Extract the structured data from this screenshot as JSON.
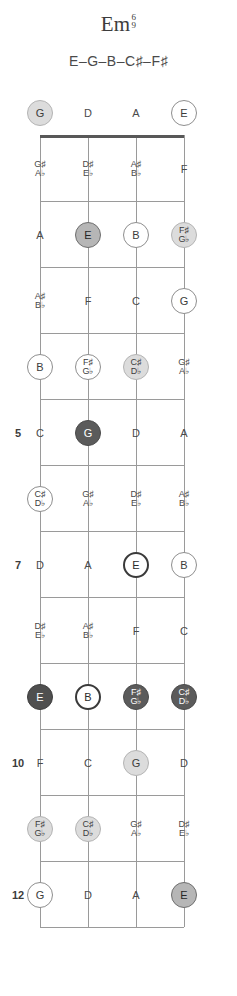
{
  "title": {
    "root": "Em",
    "ext_top": "6",
    "ext_bottom": "9"
  },
  "notes_line": "E–G–B–C♯–F♯",
  "diagram": {
    "instrument": "fretboard",
    "string_count": 4,
    "string_x": [
      40,
      88,
      136,
      184
    ],
    "nut_y": 135,
    "fret_spacing": 66,
    "fret_count": 12,
    "fret_markers": [
      "5",
      "7",
      "10",
      "12"
    ],
    "open_strings": [
      {
        "label": "G",
        "style": "fill-light"
      },
      {
        "label": "D",
        "style": "plain"
      },
      {
        "label": "A",
        "style": "plain"
      },
      {
        "label": "E",
        "style": "ring"
      }
    ],
    "frets": [
      {
        "number": 1,
        "marker": "",
        "notes": [
          {
            "label": "G♯",
            "label2": "A♭",
            "style": "plain"
          },
          {
            "label": "D♯",
            "label2": "E♭",
            "style": "plain"
          },
          {
            "label": "A♯",
            "label2": "B♭",
            "style": "plain"
          },
          {
            "label": "F",
            "label2": "",
            "style": "plain"
          }
        ]
      },
      {
        "number": 2,
        "marker": "",
        "notes": [
          {
            "label": "A",
            "label2": "",
            "style": "plain"
          },
          {
            "label": "E",
            "label2": "",
            "style": "fill-mid"
          },
          {
            "label": "B",
            "label2": "",
            "style": "ring"
          },
          {
            "label": "F♯",
            "label2": "G♭",
            "style": "fill-light"
          }
        ]
      },
      {
        "number": 3,
        "marker": "",
        "notes": [
          {
            "label": "A♯",
            "label2": "B♭",
            "style": "plain"
          },
          {
            "label": "F",
            "label2": "",
            "style": "plain"
          },
          {
            "label": "C",
            "label2": "",
            "style": "plain"
          },
          {
            "label": "G",
            "label2": "",
            "style": "ring"
          }
        ]
      },
      {
        "number": 4,
        "marker": "",
        "notes": [
          {
            "label": "B",
            "label2": "",
            "style": "ring"
          },
          {
            "label": "F♯",
            "label2": "G♭",
            "style": "ring"
          },
          {
            "label": "C♯",
            "label2": "D♭",
            "style": "fill-light"
          },
          {
            "label": "G♯",
            "label2": "A♭",
            "style": "plain"
          }
        ]
      },
      {
        "number": 5,
        "marker": "5",
        "notes": [
          {
            "label": "C",
            "label2": "",
            "style": "plain"
          },
          {
            "label": "G",
            "label2": "",
            "style": "fill-dark"
          },
          {
            "label": "D",
            "label2": "",
            "style": "plain"
          },
          {
            "label": "A",
            "label2": "",
            "style": "plain"
          }
        ]
      },
      {
        "number": 6,
        "marker": "",
        "notes": [
          {
            "label": "C♯",
            "label2": "D♭",
            "style": "ring"
          },
          {
            "label": "G♯",
            "label2": "A♭",
            "style": "plain"
          },
          {
            "label": "D♯",
            "label2": "E♭",
            "style": "plain"
          },
          {
            "label": "A♯",
            "label2": "B♭",
            "style": "plain"
          }
        ]
      },
      {
        "number": 7,
        "marker": "7",
        "notes": [
          {
            "label": "D",
            "label2": "",
            "style": "plain"
          },
          {
            "label": "A",
            "label2": "",
            "style": "plain"
          },
          {
            "label": "E",
            "label2": "",
            "style": "ring-dark"
          },
          {
            "label": "B",
            "label2": "",
            "style": "ring"
          }
        ]
      },
      {
        "number": 8,
        "marker": "",
        "notes": [
          {
            "label": "D♯",
            "label2": "E♭",
            "style": "plain"
          },
          {
            "label": "A♯",
            "label2": "B♭",
            "style": "plain"
          },
          {
            "label": "F",
            "label2": "",
            "style": "plain"
          },
          {
            "label": "C",
            "label2": "",
            "style": "plain"
          }
        ]
      },
      {
        "number": 9,
        "marker": "",
        "notes": [
          {
            "label": "E",
            "label2": "",
            "style": "fill-darker"
          },
          {
            "label": "B",
            "label2": "",
            "style": "ring-dark"
          },
          {
            "label": "F♯",
            "label2": "G♭",
            "style": "fill-dark"
          },
          {
            "label": "C♯",
            "label2": "D♭",
            "style": "fill-dark"
          }
        ]
      },
      {
        "number": 10,
        "marker": "10",
        "notes": [
          {
            "label": "F",
            "label2": "",
            "style": "plain"
          },
          {
            "label": "C",
            "label2": "",
            "style": "plain"
          },
          {
            "label": "G",
            "label2": "",
            "style": "fill-light"
          },
          {
            "label": "D",
            "label2": "",
            "style": "plain"
          }
        ]
      },
      {
        "number": 11,
        "marker": "",
        "notes": [
          {
            "label": "F♯",
            "label2": "G♭",
            "style": "fill-light"
          },
          {
            "label": "C♯",
            "label2": "D♭",
            "style": "fill-light"
          },
          {
            "label": "G♯",
            "label2": "A♭",
            "style": "plain"
          },
          {
            "label": "D♯",
            "label2": "E♭",
            "style": "plain"
          }
        ]
      },
      {
        "number": 12,
        "marker": "12",
        "notes": [
          {
            "label": "G",
            "label2": "",
            "style": "ring"
          },
          {
            "label": "D",
            "label2": "",
            "style": "plain"
          },
          {
            "label": "A",
            "label2": "",
            "style": "plain"
          },
          {
            "label": "E",
            "label2": "",
            "style": "fill-mid"
          }
        ]
      }
    ]
  }
}
